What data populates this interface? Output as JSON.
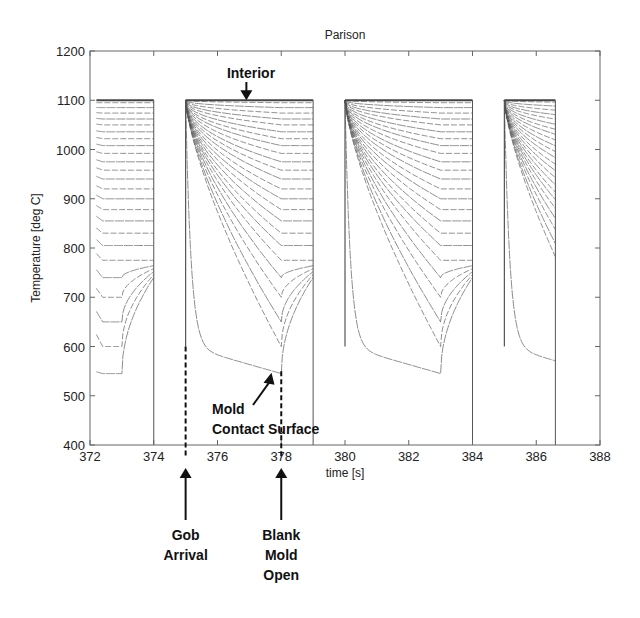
{
  "chart_data": {
    "type": "line",
    "title": "Parison",
    "xlabel": "time [s]",
    "ylabel": "Temperature [deg C]",
    "xlim": [
      372,
      388
    ],
    "ylim": [
      400,
      1200
    ],
    "xticks": [
      372,
      374,
      376,
      378,
      380,
      382,
      384,
      386,
      388
    ],
    "yticks": [
      400,
      500,
      600,
      700,
      800,
      900,
      1000,
      1100,
      1200
    ],
    "grid": false,
    "legend": "none",
    "line_color": "#555555",
    "initial_temperature": 1100,
    "cycles": [
      {
        "start": 372.2,
        "mold_open": 373.0,
        "end": 374.0,
        "surface_min": 545,
        "partial": true,
        "phase_offset": 2.8
      },
      {
        "start": 375.0,
        "mold_open": 378.0,
        "end": 379.0,
        "surface_min": 545,
        "partial": false,
        "phase_offset": 0
      },
      {
        "start": 380.0,
        "mold_open": 383.0,
        "end": 384.0,
        "surface_min": 545,
        "partial": false,
        "phase_offset": 0
      },
      {
        "start": 385.0,
        "mold_open": null,
        "end": 386.6,
        "surface_min": 560,
        "partial": true,
        "phase_offset": 0
      }
    ],
    "num_layers": 24,
    "layer_min_temperatures_at_mold_open": [
      545,
      600,
      650,
      700,
      740,
      775,
      805,
      830,
      855,
      878,
      900,
      920,
      940,
      958,
      975,
      992,
      1008,
      1022,
      1036,
      1050,
      1062,
      1074,
      1085,
      1095
    ],
    "annotations": [
      {
        "id": "interior",
        "text": "Interior",
        "points_to": [
          377.0,
          1100
        ]
      },
      {
        "id": "mold-contact-surface",
        "lines": [
          "Mold",
          "Contact Surface"
        ],
        "points_to": [
          377.6,
          555
        ]
      },
      {
        "id": "gob-arrival",
        "lines": [
          "Gob",
          "Arrival"
        ],
        "marker_x": 375.0,
        "marker_from": 600
      },
      {
        "id": "blank-mold-open",
        "lines": [
          "Blank",
          "Mold",
          "Open"
        ],
        "marker_x": 378.0,
        "marker_from": 550
      }
    ]
  }
}
